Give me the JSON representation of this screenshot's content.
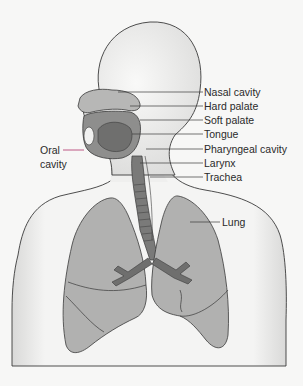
{
  "diagram": {
    "colors": {
      "background": "#f7f7f6",
      "body_fill": "#ececeb",
      "organ_fill": "#b4b4b3",
      "lung_fill": "#b1b1b0",
      "airway_fill": "#6f6f6e",
      "outline": "#3a3a3a",
      "oral_pointer": "#b0306a"
    },
    "labels": {
      "nasal_cavity": "Nasal cavity",
      "hard_palate": "Hard palate",
      "soft_palate": "Soft palate",
      "tongue": "Tongue",
      "pharyngeal_cavity": "Pharyngeal cavity",
      "larynx": "Larynx",
      "trachea": "Trachea",
      "lung": "Lung",
      "oral_cavity_line1": "Oral",
      "oral_cavity_line2": "cavity"
    }
  }
}
